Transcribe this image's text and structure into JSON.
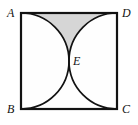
{
  "figure": {
    "shape": "square",
    "vertices": {
      "A": "A",
      "B": "B",
      "C": "C",
      "D": "D",
      "E": "E"
    },
    "colors": {
      "stroke": "#121212",
      "shaded_region": "#d6d6d6",
      "interior": "#fefefe",
      "page_background": "#ffffff"
    },
    "geometry": {
      "square_top_left": [
        21,
        13
      ],
      "square_side_px": 96,
      "arc_left": {
        "from": "A",
        "to": "B",
        "through": "E",
        "center": "midpoint of AB",
        "radius_px": 48,
        "bulge": "right"
      },
      "arc_right": {
        "from": "D",
        "to": "C",
        "through": "E",
        "center": "midpoint of DC",
        "radius_px": 48,
        "bulge": "left"
      },
      "shaded_region_description": "curvilinear triangle bounded by side AD and the two arcs meeting at E",
      "stroke_width_px": 1.6,
      "border_width_px": 2.2
    }
  }
}
